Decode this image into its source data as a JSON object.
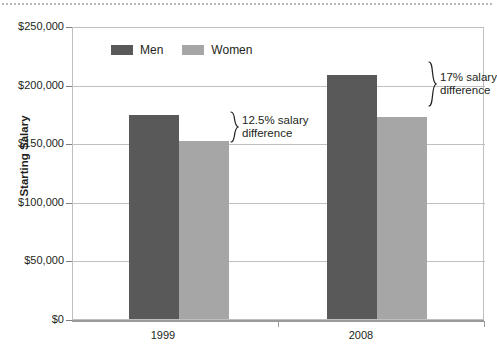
{
  "chart_data": {
    "type": "bar",
    "title": "",
    "xlabel": "",
    "ylabel": "Starting Salary",
    "categories": [
      "1999",
      "2008"
    ],
    "ylim": [
      0,
      250000
    ],
    "ytick_values": [
      0,
      50000,
      100000,
      150000,
      200000,
      250000
    ],
    "ytick_labels": [
      "$0",
      "$50,000",
      "$100,000",
      "$150,000",
      "$200,000",
      "$250,000"
    ],
    "grid": true,
    "legend_position": "top-left-inside",
    "series": [
      {
        "name": "Men",
        "color": "#595959",
        "values": [
          174000,
          208000
        ]
      },
      {
        "name": "Women",
        "color": "#a6a6a6",
        "values": [
          152000,
          172000
        ]
      }
    ],
    "annotations": [
      {
        "text_line1": "12.5% salary",
        "text_line2": "difference",
        "category": "1999",
        "value": "12.5%"
      },
      {
        "text_line1": "17% salary",
        "text_line2": "difference",
        "category": "2008",
        "value": "17%"
      }
    ]
  },
  "axis": {
    "y_title": "Starting Salary",
    "y_labels": [
      "$250,000",
      "$200,000",
      "$150,000",
      "$100,000",
      "$50,000",
      "$0"
    ],
    "x_labels": [
      "1999",
      "2008"
    ]
  },
  "legend": {
    "items": [
      {
        "label": "Men",
        "color": "#595959"
      },
      {
        "label": "Women",
        "color": "#a6a6a6"
      }
    ]
  },
  "annotations": [
    {
      "line1": "12.5% salary",
      "line2": "difference"
    },
    {
      "line1": "17% salary",
      "line2": "difference"
    }
  ],
  "colors": {
    "men": "#595959",
    "women": "#a6a6a6",
    "grid": "#bfbfbf",
    "axis": "#808080",
    "text": "#231f20",
    "background": "#ffffff"
  }
}
